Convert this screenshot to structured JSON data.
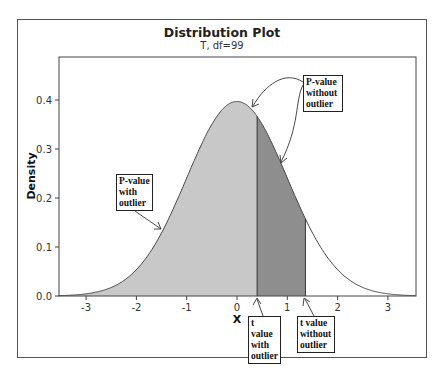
{
  "chart_data": {
    "type": "area",
    "title": "Distribution Plot",
    "subtitle": "T, df=99",
    "distribution": "T",
    "df": 99,
    "xlabel": "X",
    "ylabel": "Density",
    "xlim": [
      -3.55,
      3.55
    ],
    "ylim": [
      0,
      0.48
    ],
    "x_ticks": [
      -3,
      -2,
      -1,
      0,
      1,
      2,
      3
    ],
    "y_ticks": [
      0.0,
      0.1,
      0.2,
      0.3,
      0.4
    ],
    "y_tick_labels": [
      "0.0",
      "0.1",
      "0.2",
      "0.3",
      "0.4"
    ],
    "peak_density": 0.397,
    "shaded_regions": [
      {
        "name": "P-value with outlier",
        "from": -3.55,
        "to": 0.4,
        "color": "#c8c8c8"
      },
      {
        "name": "P-value without outlier",
        "from": 0.4,
        "to": 1.36,
        "color": "#8e8e8e"
      }
    ],
    "critical_values": [
      {
        "label": "t value with outlier",
        "x": 0.4
      },
      {
        "label": "t value without outlier",
        "x": 1.36
      }
    ],
    "grid": false,
    "legend": "none"
  },
  "annotations": {
    "p_with": [
      "P-value",
      "with",
      "outlier"
    ],
    "p_without": [
      "P-value",
      "without",
      "outlier"
    ],
    "t_with": [
      "t value",
      "with",
      "outlier"
    ],
    "t_without": [
      "t value",
      "without",
      "outlier"
    ]
  },
  "colors": {
    "light_fill": "#c8c8c8",
    "dark_fill": "#8e8e8e",
    "curve": "#444444",
    "axis": "#444444"
  }
}
